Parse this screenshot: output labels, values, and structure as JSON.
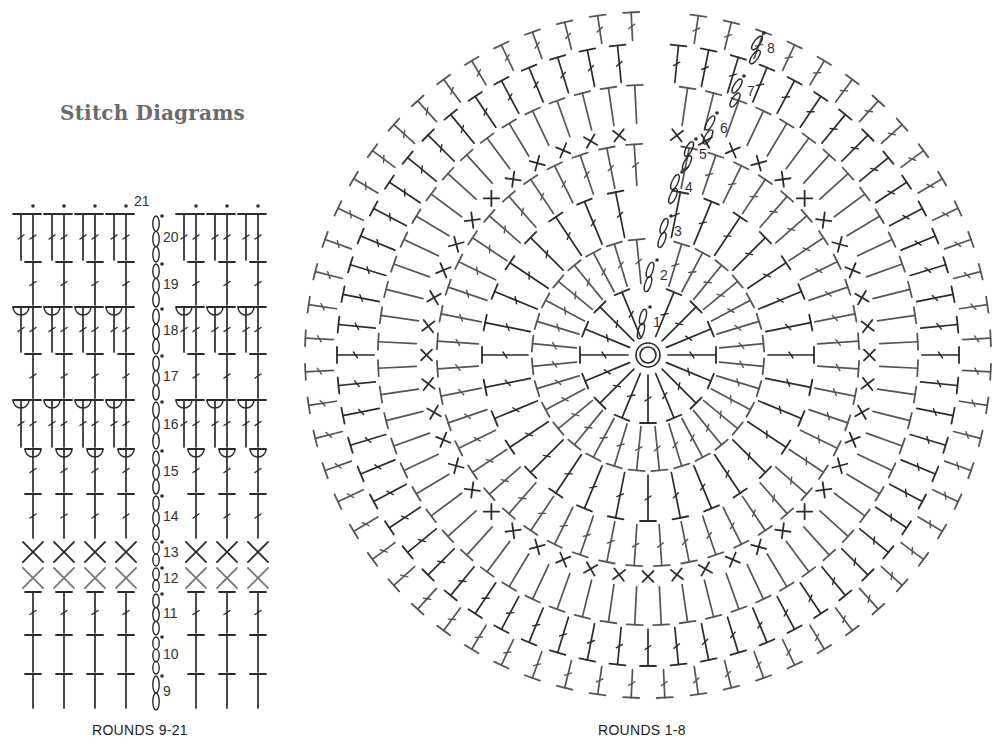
{
  "title": "Stitch Diagrams",
  "left_diagram": {
    "caption": "ROUNDS 9-21",
    "columns_x": [
      32,
      62,
      93,
      124,
      185,
      215,
      245,
      20
    ],
    "stitch_columns_x": [
      33,
      64,
      95,
      126,
      196,
      227,
      258
    ],
    "chain_x": 156,
    "rows": [
      {
        "round": 21,
        "y_top": 206,
        "y_bottom": 206,
        "stitch": "dot-label"
      },
      {
        "round": 20,
        "y_top": 212,
        "y_bottom": 260,
        "stitch": "dc-pair"
      },
      {
        "round": 19,
        "y_top": 260,
        "y_bottom": 305,
        "stitch": "dc"
      },
      {
        "round": 18,
        "y_top": 305,
        "y_bottom": 352,
        "stitch": "fpdc-pair"
      },
      {
        "round": 17,
        "y_top": 352,
        "y_bottom": 398,
        "stitch": "dc"
      },
      {
        "round": 16,
        "y_top": 398,
        "y_bottom": 447,
        "stitch": "fpdc-pair"
      },
      {
        "round": 15,
        "y_top": 447,
        "y_bottom": 492,
        "stitch": "fpdc"
      },
      {
        "round": 14,
        "y_top": 492,
        "y_bottom": 538,
        "stitch": "dc"
      },
      {
        "round": 13,
        "y_top": 538,
        "y_bottom": 564,
        "stitch": "sc"
      },
      {
        "round": 12,
        "y_top": 564,
        "y_bottom": 590,
        "stitch": "sc-light"
      },
      {
        "round": 11,
        "y_top": 590,
        "y_bottom": 633,
        "stitch": "dc"
      },
      {
        "round": 10,
        "y_top": 633,
        "y_bottom": 672,
        "stitch": "hdc"
      },
      {
        "round": 9,
        "y_top": 672,
        "y_bottom": 708,
        "stitch": "hdc"
      }
    ],
    "round_labels": [
      "21",
      "20",
      "19",
      "18",
      "17",
      "16",
      "15",
      "14",
      "13",
      "12",
      "11",
      "10",
      "9"
    ]
  },
  "right_diagram": {
    "caption": "ROUNDS 1-8",
    "center": [
      648,
      355
    ],
    "magic_ring_radius": 12,
    "rings": [
      {
        "round": 1,
        "r_inner": 18,
        "r_outer": 70,
        "count": 16,
        "stitch": "dc"
      },
      {
        "round": 2,
        "r_inner": 70,
        "r_outer": 118,
        "count": 32,
        "stitch": "dc"
      },
      {
        "round": 3,
        "r_inner": 118,
        "r_outer": 168,
        "count": 32,
        "stitch": "dc"
      },
      {
        "round": 4,
        "r_inner": 168,
        "r_outer": 213,
        "count": 48,
        "stitch": "dc"
      },
      {
        "round": 5,
        "r_inner": 213,
        "r_outer": 230,
        "count": 48,
        "stitch": "sc"
      },
      {
        "round": 6,
        "r_inner": 230,
        "r_outer": 272,
        "count": 64,
        "stitch": "hdc"
      },
      {
        "round": 7,
        "r_inner": 272,
        "r_outer": 313,
        "count": 64,
        "stitch": "dc"
      },
      {
        "round": 8,
        "r_inner": 313,
        "r_outer": 345,
        "count": 64,
        "stitch": "dc"
      }
    ],
    "round_labels": [
      {
        "label": "1",
        "x": 653,
        "y": 321
      },
      {
        "label": "2",
        "x": 660,
        "y": 274
      },
      {
        "label": "3",
        "x": 674,
        "y": 230
      },
      {
        "label": "4",
        "x": 685,
        "y": 186
      },
      {
        "label": "5",
        "x": 699,
        "y": 153
      },
      {
        "label": "6",
        "x": 720,
        "y": 127
      },
      {
        "label": "7",
        "x": 747,
        "y": 90
      },
      {
        "label": "8",
        "x": 767,
        "y": 47
      }
    ]
  },
  "colors": {
    "ink": "#2b2b2b",
    "ink_light": "#777777",
    "title": "#6b6b6b"
  }
}
